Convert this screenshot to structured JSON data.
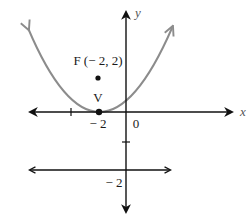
{
  "diagram": {
    "type": "parabola-graph",
    "axes": {
      "x_label": "x",
      "y_label": "y",
      "origin_label": "0"
    },
    "focus": {
      "name": "F",
      "label": "F (− 2, 2)",
      "coords": [
        -2,
        2
      ]
    },
    "vertex": {
      "name": "V",
      "label": "V",
      "coords": [
        -2,
        0
      ]
    },
    "x_tick_label": "− 2",
    "directrix": {
      "y": -2,
      "label": "− 2"
    },
    "colors": {
      "parabola": "#8c8c8c",
      "axes": "#111111",
      "points": "#111111"
    }
  }
}
